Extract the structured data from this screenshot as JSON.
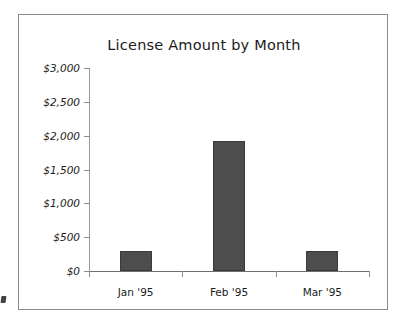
{
  "chart_data": {
    "type": "bar",
    "title": "License Amount by Month",
    "categories": [
      "Jan '95",
      "Feb '95",
      "Mar '95"
    ],
    "values": [
      300,
      1925,
      290
    ],
    "xlabel": "",
    "ylabel": "",
    "ylim": [
      0,
      3000
    ],
    "ytick_values": [
      3000,
      2500,
      2000,
      1500,
      1000,
      500,
      0
    ],
    "ytick_labels": [
      "$3,000",
      "$2,500",
      "$2,000",
      "$1,500",
      "$1,000",
      "$500",
      "$0"
    ],
    "grid": false,
    "legend": false,
    "bar_color": "#4d4d4d",
    "bar_edge_color": "#3a3a3a",
    "axis_color": "#8f8f8f",
    "frame_color": "#8d8d8d",
    "text_color": "#1b1b1b"
  }
}
